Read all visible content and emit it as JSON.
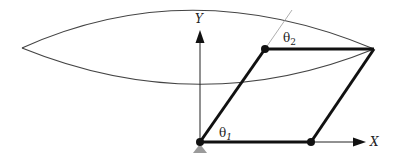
{
  "diagram": {
    "type": "five-bar parallel linkage workspace",
    "labels": {
      "x_axis": "X",
      "y_axis": "Y",
      "theta1": "θ",
      "theta1_sub": "1",
      "theta2": "θ",
      "theta2_sub": "2"
    },
    "colors": {
      "link": "#111111",
      "axis": "#222222",
      "workspace_curve": "#444444",
      "ground": "#9a9a9a"
    },
    "points": {
      "origin": [
        200,
        142
      ],
      "joint_top_left": [
        265,
        49
      ],
      "end_effector": [
        374,
        49
      ],
      "joint_bottom_right": [
        311,
        142
      ]
    }
  }
}
